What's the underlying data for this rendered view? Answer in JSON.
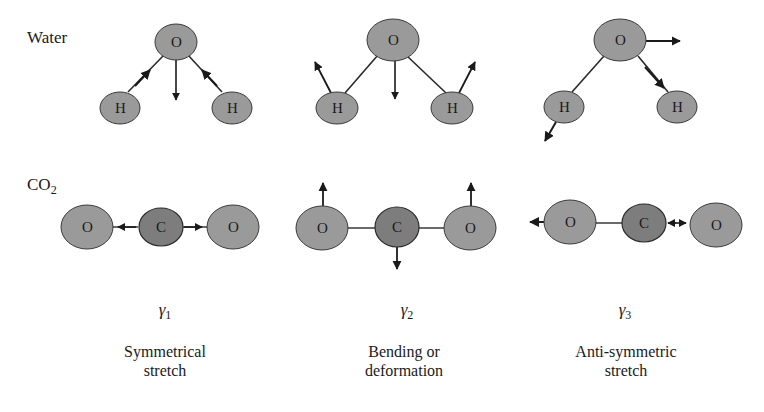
{
  "labels": {
    "water": "Water",
    "co2_main": "CO",
    "co2_sub": "2"
  },
  "modes": [
    {
      "symbol": "γ",
      "index": "1",
      "caption_line1": "Symmetrical",
      "caption_line2": "stretch"
    },
    {
      "symbol": "γ",
      "index": "2",
      "caption_line1": "Bending or",
      "caption_line2": "deformation"
    },
    {
      "symbol": "γ",
      "index": "3",
      "caption_line1": "Anti-symmetric",
      "caption_line2": "stretch"
    }
  ],
  "atoms": {
    "oxygen": "O",
    "hydrogen": "H",
    "carbon": "C"
  },
  "colors": {
    "atom_light": "#9a9a9a",
    "atom_dark": "#7d7d7d",
    "stroke": "#2a2a2a",
    "background": "#ffffff"
  }
}
